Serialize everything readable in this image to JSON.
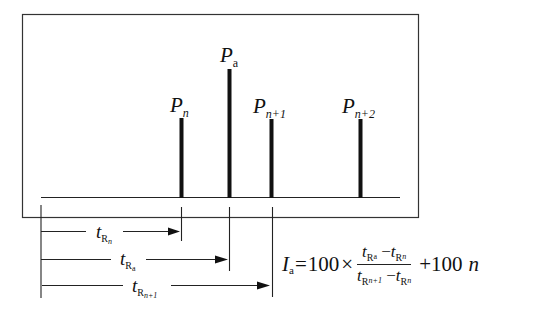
{
  "diagram": {
    "type": "chromatogram-retention-index",
    "peaks": [
      {
        "id": "Pn",
        "label_main": "P",
        "label_sub": "n",
        "x": 181,
        "top": 118
      },
      {
        "id": "Pa",
        "label_main": "P",
        "label_sub": "a",
        "x": 229,
        "top": 69
      },
      {
        "id": "Pn1",
        "label_main": "P",
        "label_sub": "n+1",
        "x": 271,
        "top": 119
      },
      {
        "id": "Pn2",
        "label_main": "P",
        "label_sub": "n+2",
        "x": 360,
        "top": 119
      }
    ],
    "retention_times": [
      {
        "id": "tRn",
        "label_main": "t",
        "label_sub": "R",
        "label_subsub": "n",
        "end_x": 181
      },
      {
        "id": "tRa",
        "label_main": "t",
        "label_sub": "R",
        "label_subsub": "a",
        "end_x": 229
      },
      {
        "id": "tRn1",
        "label_main": "t",
        "label_sub": "R",
        "label_subsub": "n+1",
        "end_x": 271
      }
    ],
    "formula": {
      "lhs_main": "I",
      "lhs_sub": "a",
      "eq": "=",
      "coef": "100",
      "times": "×",
      "numerator": {
        "a_main": "t",
        "a_sub": "R",
        "a_subsub": "a",
        "minus": "−",
        "b_main": "t",
        "b_sub": "R",
        "b_subsub": "n"
      },
      "denominator": {
        "a_main": "t",
        "a_sub": "R",
        "a_subsub": "n+1",
        "minus": "−",
        "b_main": "t",
        "b_sub": "R",
        "b_subsub": "n"
      },
      "plus": "+100",
      "tail": "n"
    }
  }
}
